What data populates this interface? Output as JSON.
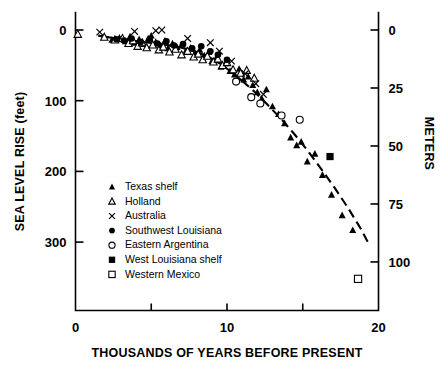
{
  "chart_data": {
    "type": "scatter",
    "title": "",
    "xlabel": "THOUSANDS OF YEARS BEFORE PRESENT",
    "ylabel": "SEA LEVEL RISE (feet)",
    "ylabel_right": "METERS",
    "xlim": [
      0,
      20
    ],
    "ylim": [
      0,
      365
    ],
    "ylim_right": [
      0,
      111.3
    ],
    "y_inverted": true,
    "grid": false,
    "legend_position": "inner-left",
    "xticks": [
      0,
      5,
      10,
      15,
      20
    ],
    "xticklabels": [
      "0",
      "",
      "10",
      "",
      "20"
    ],
    "yticks": [
      0,
      100,
      200,
      300
    ],
    "yticklabels": [
      "0",
      "100",
      "200",
      "300"
    ],
    "yticks_right": [
      0,
      25,
      50,
      75,
      100
    ],
    "yticklabels_right": [
      "0",
      "25",
      "50",
      "75",
      "100"
    ],
    "units": {
      "left": "feet",
      "right": "meters",
      "x": "thousands of years before present"
    },
    "series": [
      {
        "name": "Texas shelf",
        "marker": "filled-triangle",
        "color": "#000000",
        "points": [
          [
            2.4,
            14
          ],
          [
            2.9,
            11
          ],
          [
            3.3,
            16
          ],
          [
            3.6,
            9
          ],
          [
            3.9,
            18
          ],
          [
            4.2,
            13
          ],
          [
            4.5,
            20
          ],
          [
            4.8,
            12
          ],
          [
            5.0,
            8
          ],
          [
            5.3,
            17
          ],
          [
            5.6,
            22
          ],
          [
            5.9,
            15
          ],
          [
            6.1,
            26
          ],
          [
            6.4,
            19
          ],
          [
            6.7,
            24
          ],
          [
            7.0,
            21
          ],
          [
            7.3,
            29
          ],
          [
            7.6,
            25
          ],
          [
            7.9,
            33
          ],
          [
            8.2,
            28
          ],
          [
            8.5,
            36
          ],
          [
            8.8,
            31
          ],
          [
            9.0,
            44
          ],
          [
            9.3,
            39
          ],
          [
            9.6,
            52
          ],
          [
            9.9,
            47
          ],
          [
            10.2,
            58
          ],
          [
            10.5,
            63
          ],
          [
            10.8,
            55
          ],
          [
            11.1,
            70
          ],
          [
            11.4,
            66
          ],
          [
            11.7,
            78
          ],
          [
            12.0,
            88
          ],
          [
            12.3,
            97
          ],
          [
            12.6,
            84
          ],
          [
            13.0,
            108
          ],
          [
            13.4,
            119
          ],
          [
            13.8,
            132
          ],
          [
            14.2,
            152
          ],
          [
            14.6,
            163
          ],
          [
            14.9,
            158
          ],
          [
            15.3,
            186
          ],
          [
            15.8,
            175
          ],
          [
            16.3,
            205
          ],
          [
            16.9,
            233
          ],
          [
            17.6,
            262
          ],
          [
            18.3,
            283
          ]
        ]
      },
      {
        "name": "Holland",
        "marker": "open-triangle",
        "color": "#000000",
        "points": [
          [
            0.15,
            6
          ],
          [
            1.9,
            10
          ],
          [
            2.6,
            14
          ],
          [
            3.1,
            12
          ],
          [
            3.5,
            19
          ],
          [
            3.8,
            15
          ],
          [
            4.1,
            23
          ],
          [
            4.4,
            18
          ],
          [
            4.7,
            25
          ],
          [
            5.1,
            21
          ],
          [
            5.5,
            28
          ],
          [
            5.8,
            24
          ],
          [
            6.2,
            31
          ],
          [
            6.6,
            27
          ],
          [
            7.0,
            35
          ],
          [
            7.4,
            30
          ],
          [
            7.8,
            38
          ],
          [
            8.1,
            34
          ],
          [
            8.4,
            42
          ],
          [
            8.7,
            37
          ],
          [
            9.1,
            45
          ],
          [
            9.4,
            41
          ],
          [
            9.7,
            50
          ],
          [
            10.0,
            46
          ],
          [
            10.4,
            56
          ],
          [
            10.9,
            61
          ],
          [
            11.3,
            57
          ],
          [
            11.8,
            68
          ]
        ]
      },
      {
        "name": "Australia",
        "marker": "x",
        "color": "#000000",
        "points": [
          [
            1.6,
            3
          ],
          [
            3.9,
            2
          ],
          [
            5.3,
            1
          ],
          [
            5.7,
            0
          ],
          [
            7.4,
            12
          ],
          [
            8.9,
            18
          ],
          [
            9.5,
            30
          ],
          [
            10.3,
            44
          ],
          [
            11.2,
            62
          ],
          [
            11.9,
            76
          ],
          [
            12.4,
            91
          ]
        ]
      },
      {
        "name": "Southwest Louisiana",
        "marker": "filled-circle",
        "color": "#000000",
        "points": [
          [
            2.7,
            13
          ],
          [
            3.2,
            15
          ],
          [
            3.7,
            12
          ],
          [
            4.3,
            17
          ],
          [
            4.9,
            14
          ],
          [
            5.4,
            19
          ],
          [
            6.0,
            16
          ],
          [
            6.5,
            22
          ],
          [
            7.1,
            20
          ],
          [
            7.7,
            26
          ],
          [
            8.3,
            23
          ],
          [
            8.9,
            30
          ],
          [
            9.4,
            35
          ],
          [
            10.0,
            42
          ]
        ]
      },
      {
        "name": "Eastern Argentina",
        "marker": "open-circle",
        "color": "#000000",
        "points": [
          [
            10.6,
            73
          ],
          [
            11.6,
            95
          ],
          [
            12.2,
            104
          ],
          [
            13.6,
            121
          ],
          [
            14.8,
            127
          ]
        ]
      },
      {
        "name": "West Louisiana shelf",
        "marker": "filled-square",
        "color": "#000000",
        "points": [
          [
            16.8,
            179
          ]
        ]
      },
      {
        "name": "Western Mexico",
        "marker": "open-square",
        "color": "#000000",
        "points": [
          [
            18.65,
            352
          ]
        ]
      }
    ],
    "trend_line": {
      "style": "solid-to-dashed",
      "note": "fitted sea level curve",
      "points": [
        [
          1.5,
          8
        ],
        [
          3.0,
          13
        ],
        [
          4.5,
          17
        ],
        [
          6.0,
          21
        ],
        [
          7.0,
          25
        ],
        [
          8.0,
          31
        ],
        [
          8.8,
          38
        ],
        [
          9.5,
          47
        ],
        [
          10.2,
          58
        ],
        [
          11.0,
          72
        ],
        [
          11.8,
          87
        ],
        [
          12.6,
          104
        ],
        [
          13.5,
          124
        ],
        [
          14.4,
          146
        ],
        [
          15.3,
          170
        ],
        [
          16.2,
          196
        ],
        [
          17.1,
          223
        ],
        [
          18.0,
          252
        ],
        [
          18.8,
          280
        ],
        [
          19.3,
          300
        ]
      ],
      "dash_start_x": 11.0
    }
  },
  "legend": {
    "items": [
      {
        "label": "Texas shelf",
        "marker": "filled-triangle"
      },
      {
        "label": "Holland",
        "marker": "open-triangle"
      },
      {
        "label": "Australia",
        "marker": "x"
      },
      {
        "label": "Southwest Louisiana",
        "marker": "filled-circle"
      },
      {
        "label": "Eastern Argentina",
        "marker": "open-circle"
      },
      {
        "label": "West Louisiana shelf",
        "marker": "filled-square"
      },
      {
        "label": "Western Mexico",
        "marker": "open-square"
      }
    ]
  }
}
